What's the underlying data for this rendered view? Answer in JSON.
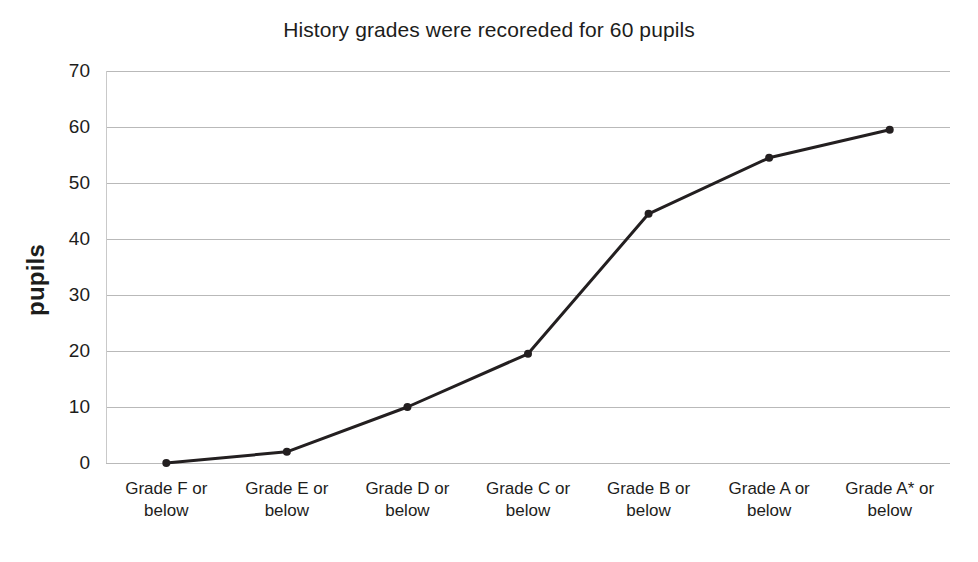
{
  "chart_data": {
    "type": "line",
    "title": "History grades were recoreded for 60 pupils",
    "xlabel": "",
    "ylabel": "pupils",
    "categories": [
      "Grade F or below",
      "Grade E or below",
      "Grade D or below",
      "Grade C or below",
      "Grade B or below",
      "Grade A or below",
      "Grade A* or below"
    ],
    "category_lines": [
      [
        "Grade F or",
        "below"
      ],
      [
        "Grade E or",
        "below"
      ],
      [
        "Grade D or",
        "below"
      ],
      [
        "Grade C or",
        "below"
      ],
      [
        "Grade B or",
        "below"
      ],
      [
        "Grade A or",
        "below"
      ],
      [
        "Grade A* or",
        "below"
      ]
    ],
    "values": [
      0,
      2,
      10,
      19.5,
      44.5,
      54.5,
      59.5
    ],
    "ylim": [
      0,
      70
    ],
    "ytick_labels": [
      "70",
      "60",
      "50",
      "40",
      "30",
      "20",
      "10",
      "0"
    ],
    "ytick_values": [
      70,
      60,
      50,
      40,
      30,
      20,
      10,
      0
    ],
    "grid": "horizontal",
    "legend": "none",
    "series_color": "#231f20",
    "grid_color": "#b9b9b9",
    "marker": "circle",
    "marker_size": 8,
    "line_width": 3
  }
}
